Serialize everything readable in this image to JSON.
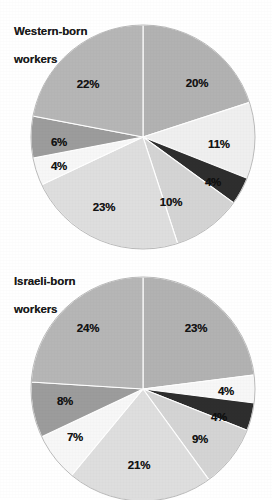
{
  "page": {
    "background": "#ffffff",
    "width": 272,
    "height": 498
  },
  "charts": [
    {
      "id": "western-born",
      "title": "Western-born\nworkers",
      "title_line1": "Western-born",
      "title_line2": "workers",
      "center": {
        "x": 143,
        "y": 137
      },
      "radius": 112
    },
    {
      "id": "israeli-born",
      "title": "Israeli-born\nworkers",
      "title_line1": "Israeli-born",
      "title_line2": "workers",
      "center": {
        "x": 143,
        "y": 139
      },
      "radius": 112
    }
  ],
  "labels": {
    "w0": "20%",
    "w1": "11%",
    "w2": "4%",
    "w3": "10%",
    "w4": "23%",
    "w5": "4%",
    "w6": "6%",
    "w7": "22%",
    "i0": "23%",
    "i1": "4%",
    "i2": "4%",
    "i3": "9%",
    "i4": "21%",
    "i5": "7%",
    "i6": "8%",
    "i7": "24%"
  },
  "chart_data": [
    {
      "type": "pie",
      "title": "Western-born workers",
      "subtitle": "",
      "xlabel": "",
      "ylabel": "",
      "legend": "none",
      "grid": false,
      "start_angle_deg": 0,
      "direction": "clockwise",
      "categories": [
        "20%",
        "11%",
        "4%",
        "10%",
        "23%",
        "4%",
        "6%",
        "22%"
      ],
      "values": [
        20,
        11,
        4,
        10,
        23,
        4,
        6,
        22
      ],
      "data_labels": [
        "20%",
        "11%",
        "4%",
        "10%",
        "23%",
        "4%",
        "6%",
        "22%"
      ],
      "colors": [
        "#b2b2b2",
        "#efefef",
        "#2e2e2e",
        "#d4d4d4",
        "#dedede",
        "#f7f7f7",
        "#9c9c9c",
        "#b6b6b6"
      ],
      "total": 100,
      "units": "percent"
    },
    {
      "type": "pie",
      "title": "Israeli-born workers",
      "subtitle": "",
      "xlabel": "",
      "ylabel": "",
      "legend": "none",
      "grid": false,
      "start_angle_deg": 0,
      "direction": "clockwise",
      "categories": [
        "23%",
        "4%",
        "4%",
        "9%",
        "21%",
        "7%",
        "8%",
        "24%"
      ],
      "values": [
        23,
        4,
        4,
        9,
        21,
        7,
        8,
        24
      ],
      "data_labels": [
        "23%",
        "4%",
        "4%",
        "9%",
        "21%",
        "7%",
        "8%",
        "24%"
      ],
      "colors": [
        "#b2b2b2",
        "#f7f7f7",
        "#2e2e2e",
        "#d4d4d4",
        "#dedede",
        "#f7f7f7",
        "#9c9c9c",
        "#b6b6b6"
      ],
      "total": 100,
      "units": "percent"
    }
  ]
}
